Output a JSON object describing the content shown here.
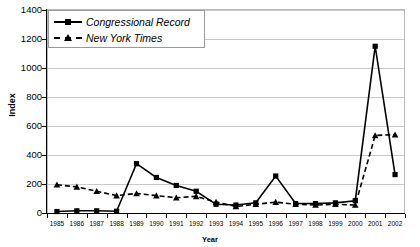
{
  "title": "",
  "axis": {
    "ylabel": "Index",
    "xlabel": "Year",
    "yticks": [
      0,
      200,
      400,
      600,
      800,
      1000,
      1200,
      1400
    ]
  },
  "legend": {
    "items": [
      {
        "label": "Congressional Record",
        "marker": "square",
        "line": "solid"
      },
      {
        "label": "New York Times",
        "marker": "triangle",
        "line": "dashed"
      }
    ]
  },
  "chart_data": {
    "type": "line",
    "title": "",
    "xlabel": "Year",
    "ylabel": "Index",
    "ylim": [
      0,
      1400
    ],
    "ytick_step": 200,
    "grid": true,
    "legend_position": "top-left",
    "categories": [
      "1985",
      "1986",
      "1987",
      "1988",
      "1989",
      "1990",
      "1991",
      "1992",
      "1993",
      "1994",
      "1995",
      "1996",
      "1997",
      "1998",
      "1999",
      "2000",
      "2001",
      "2002"
    ],
    "series": [
      {
        "name": "Congressional Record",
        "marker": "square",
        "line": "solid",
        "values": [
          10,
          15,
          15,
          12,
          340,
          245,
          190,
          150,
          60,
          55,
          70,
          255,
          65,
          65,
          70,
          85,
          1150,
          265
        ]
      },
      {
        "name": "New York Times",
        "marker": "triangle",
        "line": "dashed",
        "values": [
          195,
          180,
          150,
          120,
          135,
          120,
          105,
          115,
          75,
          45,
          60,
          75,
          60,
          55,
          60,
          55,
          535,
          540
        ]
      }
    ]
  }
}
